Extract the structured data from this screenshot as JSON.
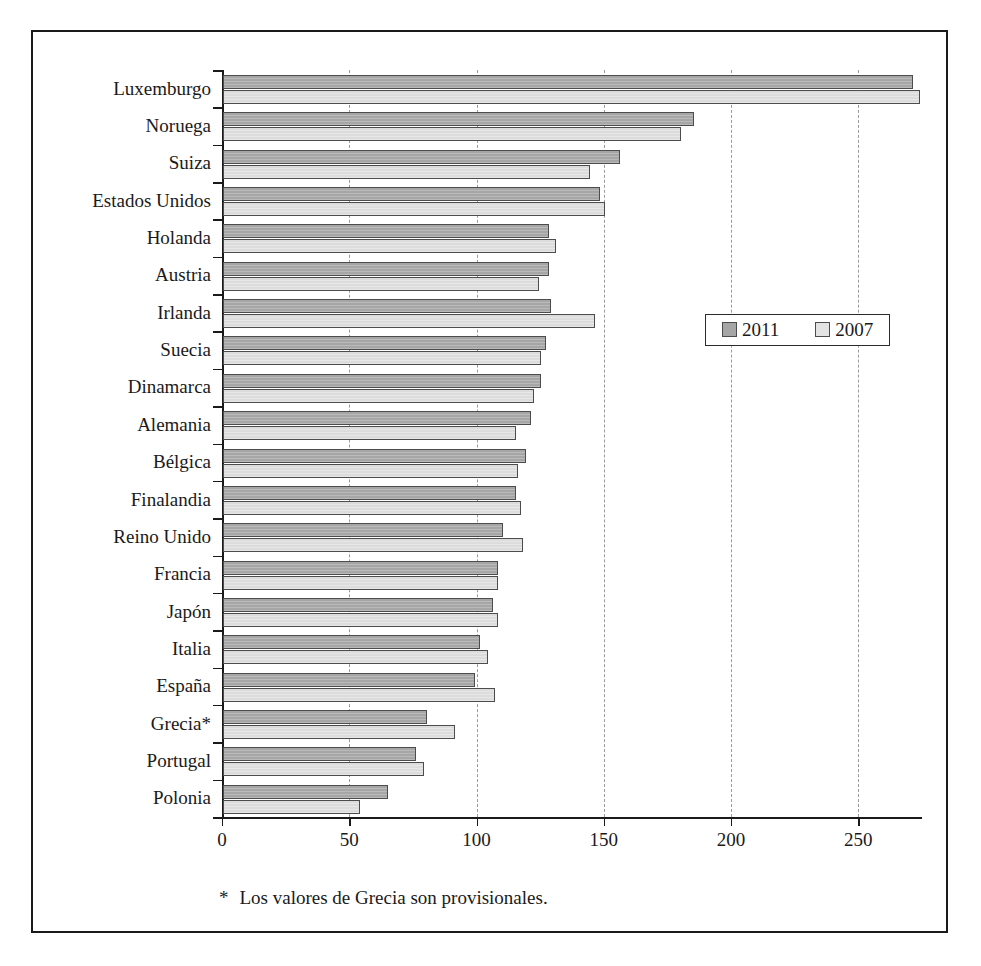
{
  "chart_data": {
    "type": "bar",
    "orientation": "horizontal",
    "title": "",
    "subtitle": "",
    "xlabel": "",
    "ylabel": "",
    "xlim": [
      0,
      275
    ],
    "ylim": null,
    "grid": "vertical-dashed",
    "legend_position": "inside-right",
    "xticks": [
      0,
      50,
      100,
      150,
      200,
      250
    ],
    "xtick_labels": [
      "0",
      "50",
      "100",
      "150",
      "200",
      "250"
    ],
    "categories": [
      "Luxemburgo",
      "Noruega",
      "Suiza",
      "Estados Unidos",
      "Holanda",
      "Austria",
      "Irlanda",
      "Suecia",
      "Dinamarca",
      "Alemania",
      "Bélgica",
      "Finalandia",
      "Reino Unido",
      "Francia",
      "Japón",
      "Italia",
      "España",
      "Grecia*",
      "Portugal",
      "Polonia"
    ],
    "series": [
      {
        "name": "2011",
        "color": "#a6a6a6",
        "values": [
          271,
          185,
          156,
          148,
          128,
          128,
          129,
          127,
          125,
          121,
          119,
          115,
          110,
          108,
          106,
          101,
          99,
          80,
          76,
          65
        ]
      },
      {
        "name": "2007",
        "color": "#dcdcdc",
        "values": [
          274,
          180,
          144,
          150,
          131,
          124,
          146,
          125,
          122,
          115,
          116,
          117,
          118,
          108,
          108,
          104,
          107,
          91,
          79,
          54
        ]
      }
    ],
    "annotations": [
      "* Los valores de Grecia son provisionales."
    ]
  },
  "legend": {
    "items": [
      {
        "label": "2011"
      },
      {
        "label": "2007"
      }
    ]
  },
  "footnote": {
    "marker": "*",
    "text": "Los valores de Grecia son provisionales."
  }
}
